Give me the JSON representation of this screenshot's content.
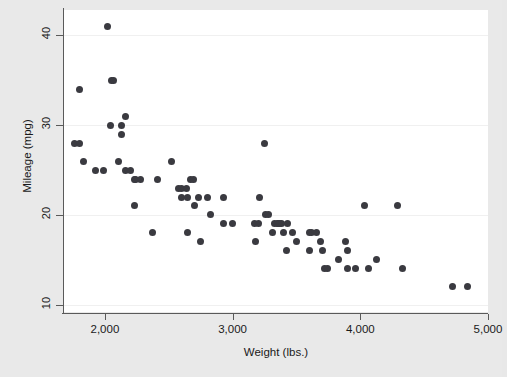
{
  "chart_data": {
    "type": "scatter",
    "title": "",
    "xlabel": "Weight (lbs.)",
    "ylabel": "Mileage (mpg)",
    "xlim": [
      1680,
      5000
    ],
    "ylim": [
      9.2,
      42.8
    ],
    "xticks": [
      2000,
      3000,
      4000,
      5000
    ],
    "xtick_labels": [
      "2,000",
      "3,000",
      "4,000",
      "5,000"
    ],
    "yticks": [
      10,
      20,
      30,
      40
    ],
    "ytick_labels": [
      "10",
      "20",
      "30",
      "40"
    ],
    "grid": "horizontal",
    "legend": null,
    "marker_color": "#3a3a40",
    "plot_background": "#ffffff",
    "figure_background": "#e9e9e9",
    "gridline_color": "#f0f0f0",
    "axis_color": "#5a5a5a",
    "n_points": 74,
    "points": [
      {
        "x": 2020,
        "y": 41
      },
      {
        "x": 1800,
        "y": 34
      },
      {
        "x": 2050,
        "y": 35
      },
      {
        "x": 2070,
        "y": 35
      },
      {
        "x": 2160,
        "y": 31
      },
      {
        "x": 2040,
        "y": 30
      },
      {
        "x": 2130,
        "y": 30
      },
      {
        "x": 2130,
        "y": 29
      },
      {
        "x": 1760,
        "y": 28
      },
      {
        "x": 1800,
        "y": 28
      },
      {
        "x": 1830,
        "y": 26
      },
      {
        "x": 1930,
        "y": 25
      },
      {
        "x": 1990,
        "y": 25
      },
      {
        "x": 2110,
        "y": 26
      },
      {
        "x": 2160,
        "y": 25
      },
      {
        "x": 2200,
        "y": 25
      },
      {
        "x": 2230,
        "y": 24
      },
      {
        "x": 2240,
        "y": 24
      },
      {
        "x": 2280,
        "y": 24
      },
      {
        "x": 2230,
        "y": 21
      },
      {
        "x": 2370,
        "y": 18
      },
      {
        "x": 2410,
        "y": 24
      },
      {
        "x": 2520,
        "y": 26
      },
      {
        "x": 2580,
        "y": 23
      },
      {
        "x": 2600,
        "y": 23
      },
      {
        "x": 2600,
        "y": 22
      },
      {
        "x": 2640,
        "y": 23
      },
      {
        "x": 2650,
        "y": 22
      },
      {
        "x": 2650,
        "y": 18
      },
      {
        "x": 2670,
        "y": 24
      },
      {
        "x": 2690,
        "y": 24
      },
      {
        "x": 2700,
        "y": 21
      },
      {
        "x": 2730,
        "y": 22
      },
      {
        "x": 2750,
        "y": 17
      },
      {
        "x": 2800,
        "y": 22
      },
      {
        "x": 2830,
        "y": 20
      },
      {
        "x": 2930,
        "y": 19
      },
      {
        "x": 2930,
        "y": 22
      },
      {
        "x": 3000,
        "y": 19
      },
      {
        "x": 3170,
        "y": 19
      },
      {
        "x": 3180,
        "y": 17
      },
      {
        "x": 3200,
        "y": 19
      },
      {
        "x": 3210,
        "y": 22
      },
      {
        "x": 3250,
        "y": 28
      },
      {
        "x": 3260,
        "y": 20
      },
      {
        "x": 3280,
        "y": 20
      },
      {
        "x": 3310,
        "y": 18
      },
      {
        "x": 3330,
        "y": 19
      },
      {
        "x": 3350,
        "y": 19
      },
      {
        "x": 3360,
        "y": 19
      },
      {
        "x": 3370,
        "y": 19
      },
      {
        "x": 3380,
        "y": 19
      },
      {
        "x": 3400,
        "y": 18
      },
      {
        "x": 3420,
        "y": 16
      },
      {
        "x": 3430,
        "y": 19
      },
      {
        "x": 3470,
        "y": 18
      },
      {
        "x": 3500,
        "y": 17
      },
      {
        "x": 3600,
        "y": 18
      },
      {
        "x": 3600,
        "y": 16
      },
      {
        "x": 3620,
        "y": 18
      },
      {
        "x": 3660,
        "y": 18
      },
      {
        "x": 3690,
        "y": 17
      },
      {
        "x": 3700,
        "y": 16
      },
      {
        "x": 3720,
        "y": 14
      },
      {
        "x": 3740,
        "y": 14
      },
      {
        "x": 3830,
        "y": 15
      },
      {
        "x": 3880,
        "y": 17
      },
      {
        "x": 3900,
        "y": 14
      },
      {
        "x": 3900,
        "y": 16
      },
      {
        "x": 3960,
        "y": 14
      },
      {
        "x": 4030,
        "y": 21
      },
      {
        "x": 4060,
        "y": 14
      },
      {
        "x": 4130,
        "y": 15
      },
      {
        "x": 4290,
        "y": 21
      },
      {
        "x": 4330,
        "y": 14
      },
      {
        "x": 4720,
        "y": 12
      },
      {
        "x": 4840,
        "y": 12
      }
    ]
  }
}
